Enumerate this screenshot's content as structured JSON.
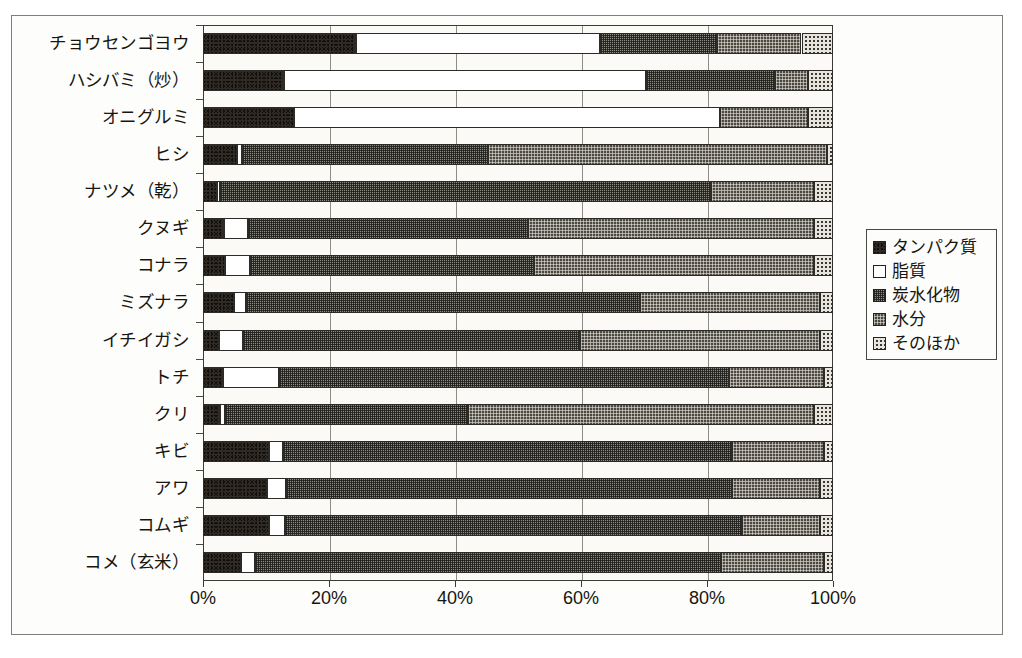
{
  "chart_data": {
    "type": "bar",
    "orientation": "horizontal",
    "stacked": true,
    "normalized_percent": true,
    "title": "",
    "xlabel": "",
    "ylabel": "",
    "xlim": [
      0,
      100
    ],
    "xticks": [
      0,
      20,
      40,
      60,
      80,
      100
    ],
    "xticklabels": [
      "0%",
      "20%",
      "40%",
      "60%",
      "80%",
      "100%"
    ],
    "grid": true,
    "legend_position": "right",
    "categories": [
      "チョウセンゴヨウ",
      "ハシバミ（炒）",
      "オニグルミ",
      "ヒシ",
      "ナツメ（乾）",
      "クヌギ",
      "コナラ",
      "ミズナラ",
      "イチイガシ",
      "トチ",
      "クリ",
      "キビ",
      "アワ",
      "コムギ",
      "コメ（玄米）"
    ],
    "series": [
      {
        "name": "タンパク質",
        "key": "protein",
        "fill": "solid-dark",
        "color": "#302a24",
        "values": [
          24.3,
          12.8,
          14.5,
          5.4,
          2.2,
          3.3,
          3.5,
          4.9,
          2.5,
          3.2,
          2.7,
          10.5,
          10.2,
          10.5,
          6.0
        ]
      },
      {
        "name": "脂質",
        "key": "fat",
        "fill": "white",
        "color": "#ffffff",
        "values": [
          38.7,
          57.5,
          67.5,
          0.8,
          0.5,
          3.8,
          4.0,
          2.0,
          3.8,
          8.8,
          0.8,
          2.2,
          3.0,
          2.5,
          2.2
        ]
      },
      {
        "name": "炭水化物",
        "key": "carb",
        "fill": "mid-gray-crosshatch",
        "color": "#8d8c84",
        "values": [
          18.6,
          20.5,
          0.0,
          39.0,
          78.0,
          44.5,
          45.0,
          62.5,
          53.5,
          71.5,
          38.5,
          71.3,
          70.8,
          72.5,
          74.0
        ]
      },
      {
        "name": "水分",
        "key": "water",
        "fill": "dark-gray-dots",
        "color": "#4d4941",
        "values": [
          13.4,
          5.2,
          14.0,
          53.8,
          16.3,
          45.4,
          44.5,
          28.6,
          38.2,
          15.0,
          55.0,
          14.5,
          14.0,
          12.5,
          16.3
        ]
      },
      {
        "name": "そのほか",
        "key": "other",
        "fill": "light-dots",
        "color": "#e6e4dc",
        "values": [
          5.0,
          4.0,
          4.0,
          1.0,
          3.0,
          3.0,
          3.0,
          2.0,
          2.0,
          1.5,
          3.0,
          1.5,
          2.0,
          2.0,
          1.5
        ]
      }
    ]
  },
  "legend": {
    "items": [
      {
        "label": "タンパク質",
        "swatch": "fill-protein"
      },
      {
        "label": "脂質",
        "swatch": "fill-fat"
      },
      {
        "label": "炭水化物",
        "swatch": "fill-carb"
      },
      {
        "label": "水分",
        "swatch": "fill-water"
      },
      {
        "label": "そのほか",
        "swatch": "fill-other"
      }
    ]
  }
}
